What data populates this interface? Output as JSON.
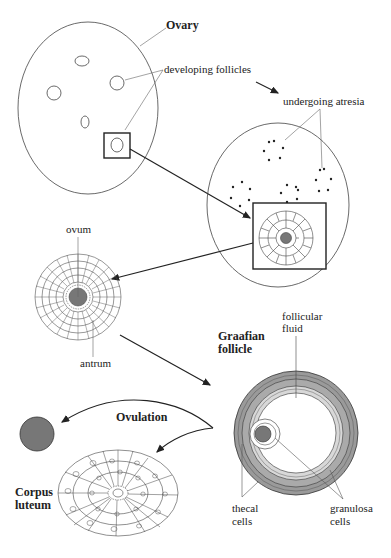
{
  "diagram": {
    "labels": {
      "ovary": "Ovary",
      "developing_follicles": "developing follicles",
      "undergoing_atresia": "undergoing atresia",
      "ovum": "ovum",
      "antrum": "antrum",
      "graafian_1": "Graafian",
      "graafian_2": "follicle",
      "follicular_fluid_1": "follicular",
      "follicular_fluid_2": "fluid",
      "ovulation": "Ovulation",
      "corpus_1": "Corpus",
      "corpus_2": "luteum",
      "thecal_1": "thecal",
      "thecal_2": "cells",
      "granulosa_1": "granulosa",
      "granulosa_2": "cells"
    },
    "colors": {
      "line": "#333333",
      "ovum_fill": "#777777",
      "thecal_fill": "#9a9a9a",
      "granulosa_fill": "#c8c8c8"
    }
  }
}
